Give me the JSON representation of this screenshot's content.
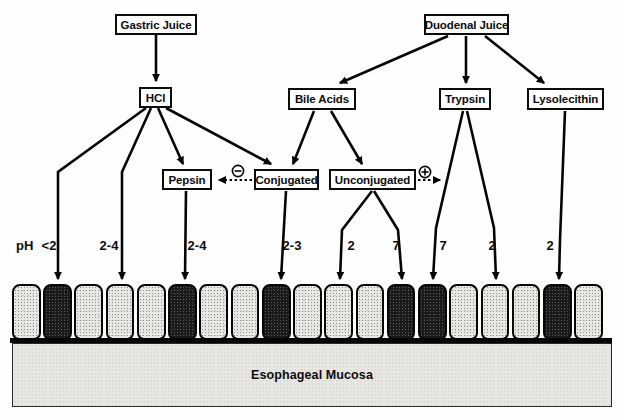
{
  "diagram": {
    "nodes": {
      "gastric_juice": "Gastric Juice",
      "duodenal_juice": "Duodenal Juice",
      "hcl": "HCl",
      "bile_acids": "Bile Acids",
      "trypsin": "Trypsin",
      "lysolecithin": "Lysolecithin",
      "pepsin": "Pepsin",
      "conjugated": "Conjugated",
      "unconjugated": "Unconjugated"
    },
    "ph": {
      "label": "pH",
      "values": [
        "<2",
        "2-4",
        "2-4",
        "2-3",
        "2",
        "7",
        "7",
        "2",
        "2"
      ]
    },
    "signs": {
      "inhibition": "−",
      "potentiation": "+"
    },
    "edges": [
      {
        "from": "Gastric Juice",
        "to": "HCl"
      },
      {
        "from": "Duodenal Juice",
        "to": "Bile Acids"
      },
      {
        "from": "Duodenal Juice",
        "to": "Trypsin"
      },
      {
        "from": "Duodenal Juice",
        "to": "Lysolecithin"
      },
      {
        "from": "HCl",
        "to": "mucosa",
        "ph": "<2",
        "damage": true
      },
      {
        "from": "HCl",
        "to": "mucosa",
        "ph": "2-4",
        "damage": false
      },
      {
        "from": "HCl",
        "to": "Pepsin"
      },
      {
        "from": "HCl",
        "to": "Conjugated"
      },
      {
        "from": "Bile Acids",
        "to": "Conjugated"
      },
      {
        "from": "Bile Acids",
        "to": "Unconjugated"
      },
      {
        "from": "Pepsin",
        "to": "mucosa",
        "ph": "2-4",
        "damage": true
      },
      {
        "from": "Conjugated",
        "to": "mucosa",
        "ph": "2-3",
        "damage": true
      },
      {
        "from": "Unconjugated",
        "to": "mucosa",
        "ph": "2",
        "damage": false
      },
      {
        "from": "Unconjugated",
        "to": "mucosa",
        "ph": "7",
        "damage": true
      },
      {
        "from": "Trypsin",
        "to": "mucosa",
        "ph": "7",
        "damage": true
      },
      {
        "from": "Trypsin",
        "to": "mucosa",
        "ph": "2",
        "damage": false
      },
      {
        "from": "Lysolecithin",
        "to": "mucosa",
        "ph": "2",
        "damage": true
      },
      {
        "from": "Conjugated",
        "to": "Pepsin",
        "type": "inhibits",
        "sign": "−"
      },
      {
        "from": "Unconjugated",
        "to": "Trypsin",
        "type": "potentiates",
        "sign": "+"
      }
    ],
    "cells": {
      "count": 19,
      "damaged_positions": [
        2,
        6,
        9,
        13,
        14,
        18
      ]
    },
    "mucosa_label": "Esophageal Mucosa",
    "colors": {
      "line": "#000000",
      "damaged_cell": "#1a1a1a",
      "healthy_cell": "#e9e8e4",
      "box_background": "#ffffff"
    }
  }
}
